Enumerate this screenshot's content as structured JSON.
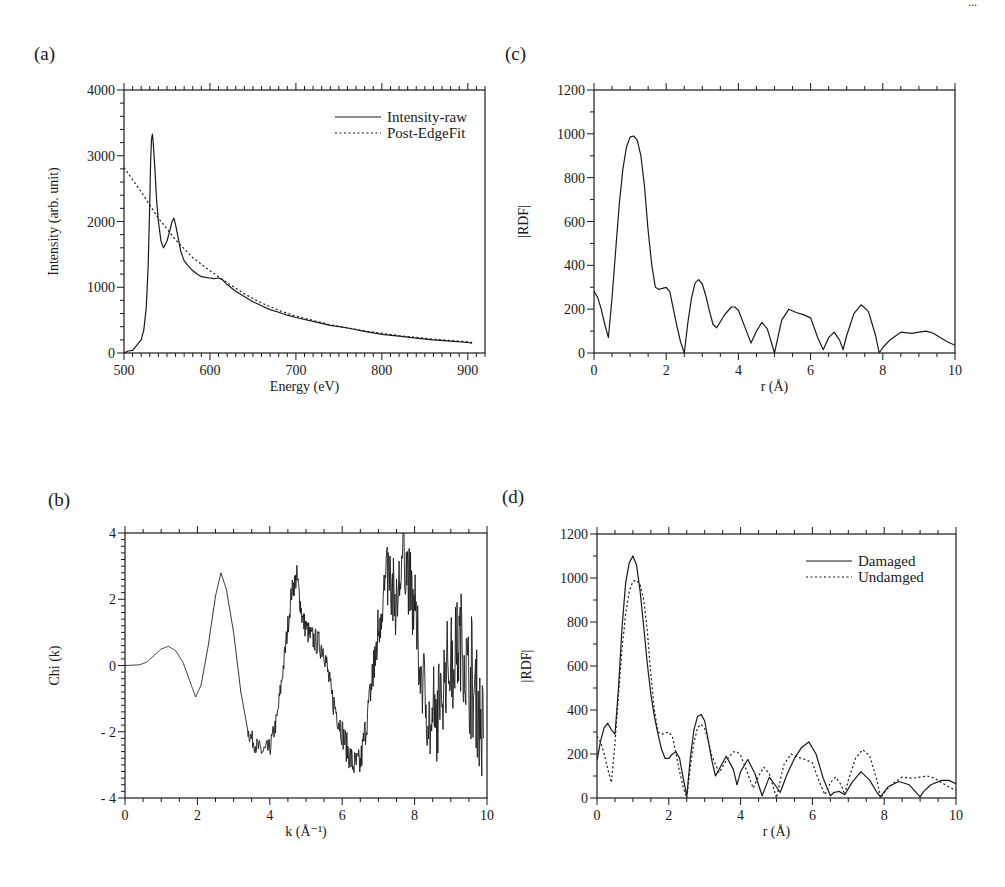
{
  "figure": {
    "corner_mark": "...",
    "panels_order": [
      "a",
      "c",
      "b",
      "d"
    ]
  },
  "chart_data": [
    {
      "id": "a",
      "panel_label": "(a)",
      "type": "line",
      "title": "",
      "xlabel": "Energy (eV)",
      "ylabel": "Intensity (arb. unit)",
      "xlim": [
        500,
        920
      ],
      "ylim": [
        0,
        4000
      ],
      "xticks": [
        500,
        600,
        700,
        800,
        900
      ],
      "yticks": [
        0,
        1000,
        2000,
        3000,
        4000
      ],
      "x_minor_step": 10,
      "y_minor_step": 200,
      "grid": false,
      "legend_position": "upper right",
      "box": {
        "x0": 124,
        "x1": 485,
        "y0": 90,
        "y1": 353
      },
      "series": [
        {
          "name": "Intensity-raw",
          "style": "solid",
          "x": [
            500,
            505,
            510,
            515,
            520,
            523,
            526,
            528,
            530,
            531,
            532,
            533,
            534,
            536,
            538,
            540,
            543,
            546,
            550,
            553,
            556,
            558,
            560,
            563,
            566,
            570,
            575,
            580,
            585,
            590,
            595,
            600,
            605,
            610,
            615,
            620,
            630,
            640,
            650,
            660,
            670,
            680,
            690,
            700,
            720,
            740,
            760,
            780,
            800,
            820,
            840,
            860,
            880,
            900,
            905
          ],
          "values": [
            0,
            30,
            40,
            120,
            200,
            350,
            700,
            1300,
            2300,
            2900,
            3250,
            3330,
            3200,
            2800,
            2300,
            2000,
            1700,
            1600,
            1700,
            1850,
            2000,
            2050,
            1950,
            1750,
            1550,
            1400,
            1320,
            1250,
            1200,
            1160,
            1150,
            1140,
            1130,
            1140,
            1110,
            1040,
            940,
            860,
            780,
            720,
            660,
            620,
            575,
            540,
            480,
            420,
            380,
            330,
            285,
            255,
            225,
            200,
            180,
            160,
            150
          ]
        },
        {
          "name": "Post-EdgeFit",
          "style": "dotted",
          "x": [
            500,
            520,
            540,
            560,
            580,
            600,
            620,
            640,
            660,
            680,
            700,
            740,
            780,
            820,
            860,
            900,
            905
          ],
          "values": [
            2820,
            2450,
            2050,
            1720,
            1450,
            1250,
            1070,
            900,
            760,
            650,
            560,
            430,
            335,
            265,
            210,
            170,
            160
          ]
        }
      ]
    },
    {
      "id": "c",
      "panel_label": "(c)",
      "type": "line",
      "title": "",
      "xlabel": "r (Å)",
      "ylabel": "|RDF|",
      "xlim": [
        0,
        10
      ],
      "ylim": [
        0,
        1200
      ],
      "xticks": [
        0,
        2,
        4,
        6,
        8,
        10
      ],
      "yticks": [
        0,
        200,
        400,
        600,
        800,
        1000,
        1200
      ],
      "x_minor_step": 0.5,
      "y_minor_step": 100,
      "grid": false,
      "legend_position": "none",
      "box": {
        "x0": 594,
        "x1": 955,
        "y0": 90,
        "y1": 353
      },
      "series": [
        {
          "name": "RDF",
          "style": "solid",
          "x": [
            0,
            0.1,
            0.2,
            0.3,
            0.4,
            0.5,
            0.6,
            0.7,
            0.8,
            0.9,
            1.0,
            1.1,
            1.2,
            1.3,
            1.4,
            1.5,
            1.6,
            1.7,
            1.8,
            1.9,
            2.0,
            2.1,
            2.2,
            2.3,
            2.4,
            2.5,
            2.6,
            2.7,
            2.8,
            2.9,
            3.0,
            3.1,
            3.2,
            3.3,
            3.4,
            3.6,
            3.8,
            3.9,
            4.0,
            4.2,
            4.35,
            4.5,
            4.65,
            4.8,
            5.0,
            5.2,
            5.4,
            5.6,
            5.8,
            6.0,
            6.2,
            6.35,
            6.5,
            6.65,
            6.8,
            6.9,
            7.0,
            7.2,
            7.4,
            7.6,
            7.8,
            7.9,
            8.0,
            8.2,
            8.5,
            8.8,
            9.0,
            9.2,
            9.4,
            9.6,
            9.8,
            10.0
          ],
          "values": [
            280,
            255,
            200,
            130,
            70,
            250,
            470,
            680,
            840,
            940,
            985,
            990,
            970,
            900,
            760,
            560,
            400,
            300,
            290,
            295,
            300,
            280,
            200,
            120,
            50,
            0,
            140,
            250,
            320,
            335,
            315,
            260,
            190,
            130,
            115,
            170,
            210,
            210,
            195,
            110,
            45,
            100,
            140,
            110,
            0,
            150,
            200,
            185,
            175,
            160,
            70,
            15,
            70,
            95,
            60,
            15,
            80,
            180,
            220,
            190,
            80,
            0,
            25,
            60,
            95,
            90,
            95,
            100,
            90,
            70,
            50,
            35
          ]
        }
      ]
    },
    {
      "id": "b",
      "panel_label": "(b)",
      "type": "line",
      "title": "",
      "xlabel": "k (Å⁻¹)",
      "ylabel": "Chi (k)",
      "xlim": [
        0,
        10
      ],
      "ylim": [
        -4,
        4
      ],
      "xticks": [
        0,
        2,
        4,
        6,
        8,
        10
      ],
      "yticks": [
        -4,
        -2,
        0,
        2,
        4
      ],
      "ytick_labels": [
        "- 4",
        "- 2",
        "0",
        "2",
        "4"
      ],
      "x_minor_step": 0.5,
      "y_minor_step": 0.2,
      "grid": false,
      "legend_position": "none",
      "box": {
        "x0": 125,
        "x1": 487,
        "y0": 533,
        "y1": 798
      },
      "series": [
        {
          "name": "Chi(k)",
          "style": "solid",
          "noise": "increasing noise beyond k≈3.5 (noisy experimental signal)",
          "x": [
            0,
            0.4,
            0.6,
            0.8,
            1.0,
            1.2,
            1.4,
            1.6,
            1.8,
            1.95,
            2.1,
            2.3,
            2.5,
            2.65,
            2.8,
            3.0,
            3.2,
            3.4,
            3.6,
            3.8,
            4.0,
            4.2,
            4.4,
            4.6,
            4.75,
            4.9,
            5.1,
            5.3,
            5.5,
            5.7,
            5.9,
            6.1,
            6.3,
            6.5,
            6.7,
            6.9,
            7.1,
            7.3,
            7.5,
            7.7,
            7.9,
            8.1,
            8.3,
            8.5,
            8.7,
            8.9,
            9.1,
            9.3,
            9.5,
            9.7,
            9.9
          ],
          "values": [
            0,
            0.02,
            0.1,
            0.3,
            0.5,
            0.58,
            0.45,
            0.1,
            -0.5,
            -0.95,
            -0.6,
            0.6,
            2.1,
            2.8,
            2.3,
            1.0,
            -0.8,
            -2.0,
            -2.4,
            -2.6,
            -2.5,
            -1.6,
            0.2,
            2.2,
            2.7,
            1.4,
            0.9,
            0.7,
            0.5,
            -0.9,
            -1.6,
            -2.4,
            -3.0,
            -3.0,
            -1.5,
            0.2,
            2.0,
            2.8,
            1.8,
            3.5,
            2.2,
            0.5,
            -1.0,
            -2.3,
            -1.0,
            0.0,
            0.3,
            0.8,
            -0.5,
            -1.0,
            -2.2
          ]
        }
      ]
    },
    {
      "id": "d",
      "panel_label": "(d)",
      "type": "line",
      "title": "",
      "xlabel": "r (Å)",
      "ylabel": "|RDF|",
      "xlim": [
        0,
        10
      ],
      "ylim": [
        0,
        1200
      ],
      "xticks": [
        0,
        2,
        4,
        6,
        8,
        10
      ],
      "yticks": [
        0,
        200,
        400,
        600,
        800,
        1000,
        1200
      ],
      "x_minor_step": 0.5,
      "y_minor_step": 100,
      "grid": false,
      "legend_position": "upper right",
      "box": {
        "x0": 597,
        "x1": 956,
        "y0": 534,
        "y1": 798
      },
      "series": [
        {
          "name": "Damaged",
          "style": "solid",
          "x": [
            0,
            0.1,
            0.2,
            0.3,
            0.4,
            0.5,
            0.6,
            0.7,
            0.8,
            0.9,
            1.0,
            1.1,
            1.2,
            1.3,
            1.4,
            1.5,
            1.6,
            1.7,
            1.8,
            1.9,
            2.0,
            2.1,
            2.2,
            2.3,
            2.4,
            2.5,
            2.6,
            2.7,
            2.8,
            2.9,
            3.0,
            3.1,
            3.2,
            3.3,
            3.4,
            3.6,
            3.8,
            3.9,
            4.0,
            4.2,
            4.4,
            4.6,
            4.8,
            5.0,
            5.1,
            5.3,
            5.5,
            5.7,
            5.9,
            6.1,
            6.3,
            6.5,
            6.6,
            6.75,
            6.9,
            7.1,
            7.35,
            7.6,
            7.8,
            7.9,
            8.1,
            8.4,
            8.7,
            9.0,
            9.1,
            9.3,
            9.6,
            9.8,
            10.0
          ],
          "values": [
            170,
            260,
            320,
            340,
            310,
            290,
            500,
            780,
            980,
            1070,
            1100,
            1060,
            940,
            780,
            610,
            470,
            370,
            290,
            220,
            180,
            180,
            200,
            210,
            180,
            90,
            10,
            180,
            310,
            370,
            380,
            350,
            260,
            170,
            100,
            130,
            190,
            130,
            60,
            120,
            175,
            110,
            10,
            95,
            50,
            25,
            110,
            180,
            230,
            255,
            200,
            90,
            10,
            25,
            30,
            15,
            70,
            120,
            80,
            25,
            5,
            50,
            75,
            60,
            5,
            30,
            60,
            80,
            80,
            65
          ]
        },
        {
          "name": "Undamged",
          "style": "dotted",
          "x": [
            0,
            0.1,
            0.2,
            0.3,
            0.4,
            0.5,
            0.6,
            0.7,
            0.8,
            0.9,
            1.0,
            1.1,
            1.2,
            1.3,
            1.4,
            1.5,
            1.6,
            1.7,
            1.8,
            1.9,
            2.0,
            2.1,
            2.2,
            2.3,
            2.4,
            2.5,
            2.6,
            2.7,
            2.8,
            2.9,
            3.0,
            3.1,
            3.2,
            3.4,
            3.6,
            3.8,
            3.9,
            4.0,
            4.2,
            4.35,
            4.5,
            4.65,
            4.8,
            5.0,
            5.2,
            5.4,
            5.6,
            5.8,
            6.0,
            6.2,
            6.35,
            6.5,
            6.65,
            6.8,
            6.9,
            7.0,
            7.2,
            7.4,
            7.6,
            7.8,
            7.9,
            8.0,
            8.2,
            8.5,
            8.8,
            9.0,
            9.2,
            9.4,
            9.6,
            9.8,
            10.0
          ],
          "values": [
            280,
            255,
            200,
            130,
            70,
            250,
            470,
            680,
            840,
            940,
            985,
            990,
            970,
            900,
            760,
            560,
            400,
            300,
            290,
            295,
            300,
            280,
            200,
            120,
            50,
            0,
            140,
            250,
            320,
            335,
            315,
            260,
            190,
            115,
            170,
            210,
            210,
            195,
            110,
            45,
            100,
            140,
            110,
            0,
            150,
            200,
            185,
            175,
            160,
            70,
            15,
            70,
            95,
            60,
            15,
            80,
            180,
            220,
            190,
            80,
            0,
            25,
            60,
            95,
            90,
            95,
            100,
            90,
            70,
            50,
            35
          ]
        }
      ]
    }
  ]
}
